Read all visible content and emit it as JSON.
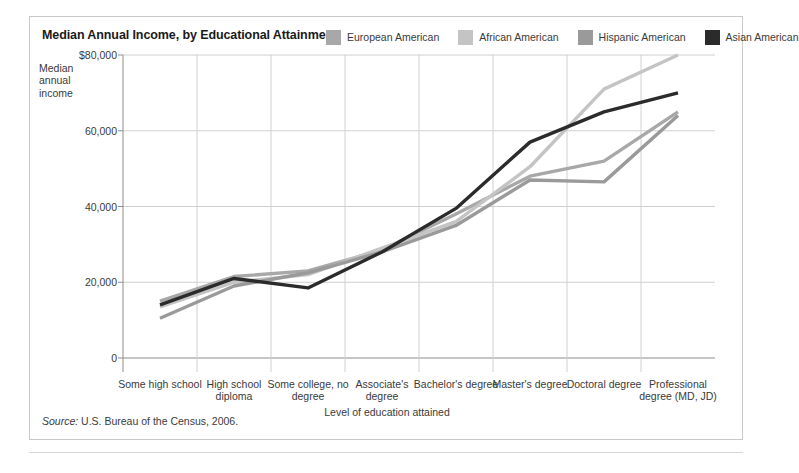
{
  "figure": {
    "title": "Median Annual Income, by Educational Attainment",
    "source_prefix": "Source:",
    "source_text": " U.S. Bureau of the Census, 2006."
  },
  "legend": {
    "items": [
      {
        "label": "European American",
        "color": "#a8a8a8"
      },
      {
        "label": "African American",
        "color": "#c4c4c4"
      },
      {
        "label": "Hispanic American",
        "color": "#9a9a9a"
      },
      {
        "label": "Asian American",
        "color": "#2b2b2b"
      }
    ]
  },
  "axes": {
    "y_title": "Median annual income",
    "x_title": "Level of education attained",
    "y_ticks": [
      "$80,000",
      "60,000",
      "40,000",
      "20,000",
      "0"
    ]
  },
  "chart_data": {
    "type": "line",
    "title": "Median Annual Income, by Educational Attainment",
    "xlabel": "Level of education attained",
    "ylabel": "Median annual income",
    "ylim": [
      0,
      80000
    ],
    "yticks": [
      0,
      20000,
      40000,
      60000,
      80000
    ],
    "grid": true,
    "legend_position": "top-right",
    "categories": [
      "Some high school",
      "High school diploma",
      "Some college, no degree",
      "Associate's degree",
      "Bachelor's degree",
      "Master's degree",
      "Doctoral degree",
      "Professional degree (MD, JD)"
    ],
    "series": [
      {
        "name": "European American",
        "color": "#a8a8a8",
        "values": [
          15000,
          21500,
          23000,
          28500,
          38000,
          48000,
          52000,
          65000
        ]
      },
      {
        "name": "African American",
        "color": "#c4c4c4",
        "values": [
          13500,
          20000,
          22000,
          29000,
          36000,
          50500,
          71000,
          80000
        ]
      },
      {
        "name": "Hispanic American",
        "color": "#9a9a9a",
        "values": [
          10500,
          19000,
          22500,
          28000,
          35000,
          47000,
          46500,
          64000
        ]
      },
      {
        "name": "Asian American",
        "color": "#2b2b2b",
        "values": [
          14000,
          21000,
          18500,
          28000,
          39500,
          57000,
          65000,
          70000
        ]
      }
    ]
  }
}
